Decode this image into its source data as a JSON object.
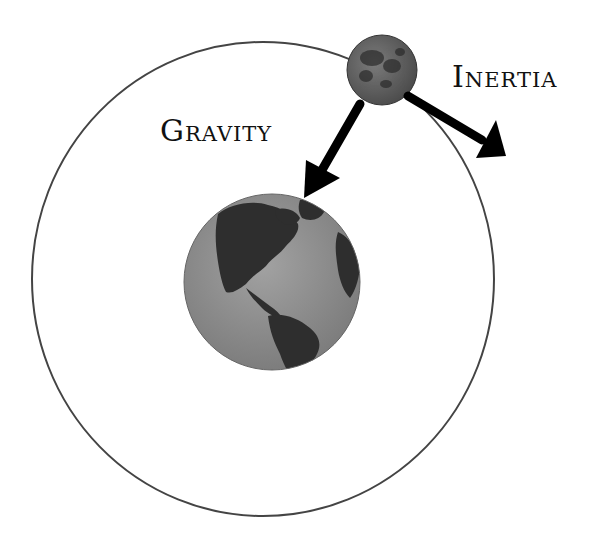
{
  "diagram": {
    "title": "",
    "labels": {
      "gravity": "Gravity",
      "inertia": "Inertia"
    },
    "nodes": [
      {
        "id": "earth",
        "kind": "planet",
        "icon": "earth-globe-icon",
        "center": [
          272,
          282
        ],
        "radius": 88,
        "fill": "#8a8a8a",
        "land": "#2e2e2e"
      },
      {
        "id": "moon",
        "kind": "moon",
        "icon": "moon-icon",
        "center": [
          382,
          70
        ],
        "radius": 35,
        "fill": "#6e6e6e"
      }
    ],
    "orbit": {
      "center": [
        263,
        279
      ],
      "rx": 231,
      "ry": 237,
      "stroke": "#444444"
    },
    "edges": [
      {
        "id": "gravity-arrow",
        "from": "moon",
        "to": "earth",
        "label": "Gravity",
        "color": "#000000"
      },
      {
        "id": "inertia-arrow",
        "from": "moon",
        "to": "tangent",
        "label": "Inertia",
        "color": "#000000"
      }
    ]
  }
}
